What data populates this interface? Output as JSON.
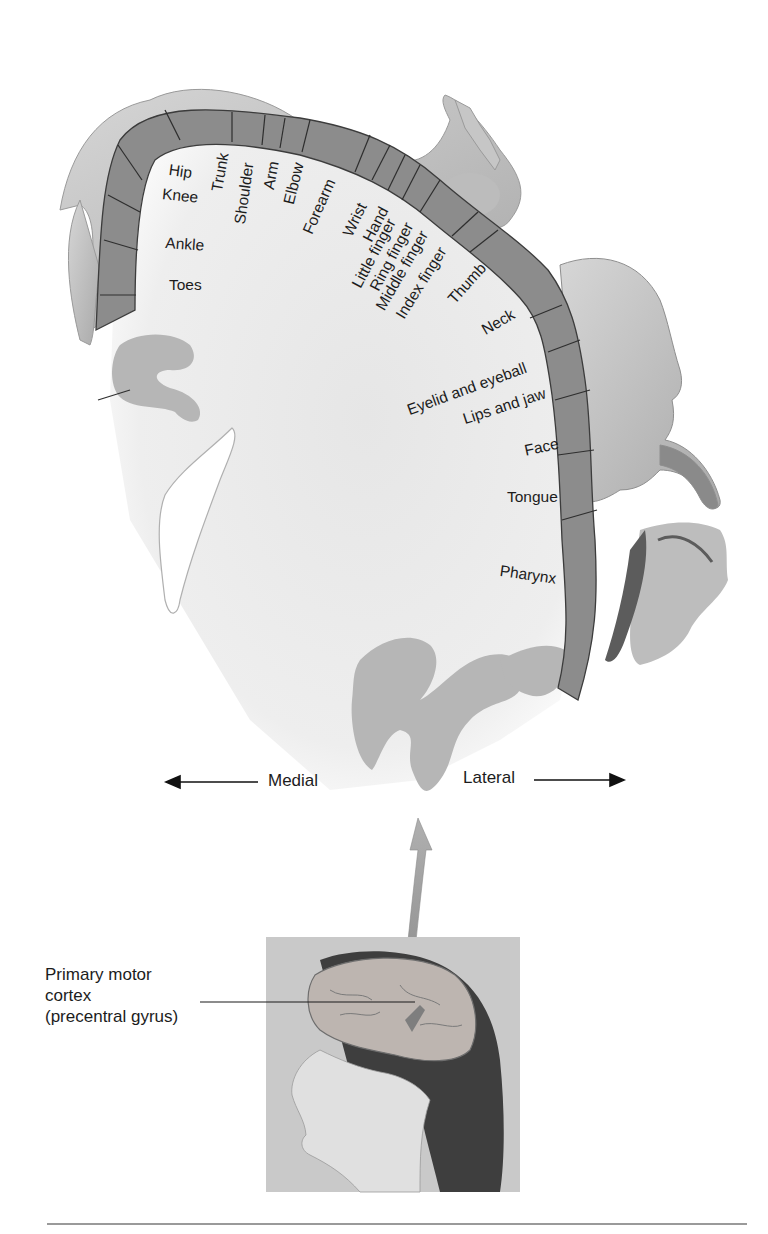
{
  "figure": {
    "cortex_labels": [
      {
        "id": "hip",
        "text": "Hip"
      },
      {
        "id": "trunk",
        "text": "Trunk"
      },
      {
        "id": "knee",
        "text": "Knee"
      },
      {
        "id": "ankle",
        "text": "Ankle"
      },
      {
        "id": "toes",
        "text": "Toes"
      },
      {
        "id": "shoulder",
        "text": "Shoulder"
      },
      {
        "id": "arm",
        "text": "Arm"
      },
      {
        "id": "elbow",
        "text": "Elbow"
      },
      {
        "id": "forearm",
        "text": "Forearm"
      },
      {
        "id": "wrist",
        "text": "Wrist"
      },
      {
        "id": "hand",
        "text": "Hand"
      },
      {
        "id": "little-finger",
        "text": "Little finger"
      },
      {
        "id": "ring-finger",
        "text": "Ring finger"
      },
      {
        "id": "middle-finger",
        "text": "Middle finger"
      },
      {
        "id": "index-finger",
        "text": "Index finger"
      },
      {
        "id": "thumb",
        "text": "Thumb"
      },
      {
        "id": "neck",
        "text": "Neck"
      },
      {
        "id": "eyelid-and-eyeball",
        "text": "Eyelid and eyeball"
      },
      {
        "id": "lips-and-jaw",
        "text": "Lips and jaw"
      },
      {
        "id": "face",
        "text": "Face"
      },
      {
        "id": "tongue",
        "text": "Tongue"
      },
      {
        "id": "pharynx",
        "text": "Pharynx"
      }
    ],
    "directions": {
      "medial": "Medial",
      "lateral": "Lateral"
    },
    "callout": {
      "line1": "Primary motor",
      "line2": "cortex",
      "line3": "(precentral gyrus)"
    },
    "colors": {
      "cortex_band": "#8c8c8c",
      "white_matter": "#ececec",
      "gray_folds": "#b4b4b4",
      "body_skin": "#c8c8c8",
      "ink": "#1c1c1c"
    }
  }
}
